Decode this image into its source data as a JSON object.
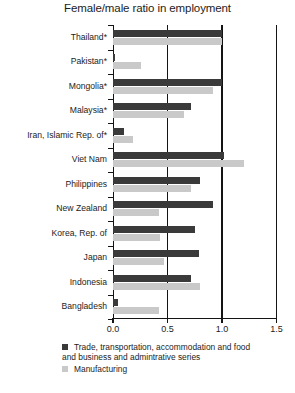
{
  "chart_data": {
    "type": "bar",
    "orientation": "horizontal",
    "title": "Female/male ratio in employment",
    "xlabel": "",
    "ylabel": "",
    "xlim": [
      0.0,
      1.5
    ],
    "xticks": [
      "0.0",
      "0.5",
      "1.0",
      "1.5"
    ],
    "xtick_values": [
      0.0,
      0.5,
      1.0,
      1.5
    ],
    "grid": true,
    "legend_position": "bottom-left",
    "categories": [
      "Thailand*",
      "Pakistan*",
      "Mongolia*",
      "Malaysia*",
      "Iran, Islamic Rep. of*",
      "Viet Nam",
      "Philippines",
      "New Zealand",
      "Korea, Rep. of",
      "Japan",
      "Indonesia",
      "Bangladesh"
    ],
    "series": [
      {
        "name": "Trade, transportation, accommodation and food and business and admintrative series",
        "color": "#3a3a3a",
        "values": [
          1.0,
          0.02,
          1.0,
          0.72,
          0.1,
          1.02,
          0.8,
          0.92,
          0.75,
          0.79,
          0.72,
          0.05
        ]
      },
      {
        "name": "Manufacturing",
        "color": "#c9c9c9",
        "values": [
          1.0,
          0.26,
          0.92,
          0.65,
          0.18,
          1.2,
          0.72,
          0.42,
          0.43,
          0.47,
          0.8,
          0.42
        ]
      }
    ]
  },
  "legend": {
    "items": [
      {
        "label_line1": "Trade, transportation, accommodation and food",
        "label_line2": "and business and admintrative series",
        "swatch": "dark-square-swatch"
      },
      {
        "label_line1": "Manufacturing",
        "label_line2": "",
        "swatch": "light-square-swatch"
      }
    ]
  }
}
